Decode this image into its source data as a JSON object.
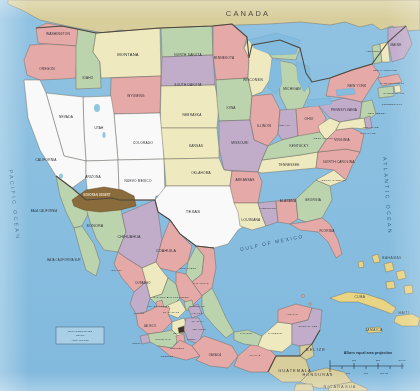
{
  "map": {
    "title": "Political map of the United States, Mexico and Central America",
    "projection_note": "Albers equal area projection",
    "countries": [
      {
        "name": "CANADA",
        "x": 248,
        "y": 14,
        "cls": "ctry"
      },
      {
        "name": "GUATEMALA",
        "x": 295,
        "y": 371,
        "cls": "ctry2"
      },
      {
        "name": "BELIZE",
        "x": 316,
        "y": 350,
        "cls": "ctry2"
      },
      {
        "name": "HONDURAS",
        "x": 318,
        "y": 375,
        "cls": "ctry2"
      },
      {
        "name": "NICARAGUA",
        "x": 340,
        "y": 387,
        "cls": "ctry2"
      }
    ],
    "oceans": [
      {
        "name": "PACIFIC OCEAN",
        "x": 14,
        "y": 205
      },
      {
        "name": "ATLANTIC OCEAN",
        "x": 387,
        "y": 196
      },
      {
        "name": "GULF OF MEXICO",
        "x": 272,
        "y": 243
      }
    ],
    "islands": [
      {
        "name": "BAHAMAS",
        "x": 392,
        "y": 258
      },
      {
        "name": "CUBA",
        "x": 360,
        "y": 297
      },
      {
        "name": "HAITI",
        "x": 404,
        "y": 313
      },
      {
        "name": "JAMAICA",
        "x": 374,
        "y": 330
      }
    ],
    "us_states": [
      {
        "name": "WASHINGTON",
        "x": 58,
        "y": 34,
        "cls": "st-sm"
      },
      {
        "name": "OREGON",
        "x": 47,
        "y": 69,
        "cls": "st-sm"
      },
      {
        "name": "IDAHO",
        "x": 88,
        "y": 78,
        "cls": "st-sm"
      },
      {
        "name": "MONTANA",
        "x": 128,
        "y": 55,
        "cls": "st"
      },
      {
        "name": "WYOMING",
        "x": 136,
        "y": 96,
        "cls": "st-sm"
      },
      {
        "name": "NORTH DAKOTA",
        "x": 188,
        "y": 55,
        "cls": "st-sm"
      },
      {
        "name": "SOUTH DAKOTA",
        "x": 188,
        "y": 85,
        "cls": "st-sm"
      },
      {
        "name": "NEBRASKA",
        "x": 192,
        "y": 115,
        "cls": "st-sm"
      },
      {
        "name": "MINNESOTA",
        "x": 224,
        "y": 58,
        "cls": "st-sm"
      },
      {
        "name": "IOWA",
        "x": 231,
        "y": 108,
        "cls": "st-sm"
      },
      {
        "name": "WISCONSIN",
        "x": 253,
        "y": 80,
        "cls": "st-sm"
      },
      {
        "name": "MICHIGAN",
        "x": 292,
        "y": 89,
        "cls": "st-sm"
      },
      {
        "name": "ILLINOIS",
        "x": 264,
        "y": 126,
        "cls": "st-sm"
      },
      {
        "name": "INDIANA",
        "x": 285,
        "y": 125,
        "cls": "st-xs"
      },
      {
        "name": "OHIO",
        "x": 309,
        "y": 119,
        "cls": "st-sm"
      },
      {
        "name": "MISSOURI",
        "x": 240,
        "y": 143,
        "cls": "st-sm"
      },
      {
        "name": "KANSAS",
        "x": 196,
        "y": 146,
        "cls": "st-sm"
      },
      {
        "name": "COLORADO",
        "x": 143,
        "y": 143,
        "cls": "st-sm"
      },
      {
        "name": "UTAH",
        "x": 99,
        "y": 128,
        "cls": "st-sm"
      },
      {
        "name": "NEVADA",
        "x": 66,
        "y": 117,
        "cls": "st-sm"
      },
      {
        "name": "CALIFORNIA",
        "x": 46,
        "y": 160,
        "cls": "st-sm"
      },
      {
        "name": "ARIZONA",
        "x": 93,
        "y": 177,
        "cls": "st-sm"
      },
      {
        "name": "NUEVO MEXICO",
        "x": 138,
        "y": 181,
        "cls": "st-sm"
      },
      {
        "name": "OKLAHOMA",
        "x": 201,
        "y": 173,
        "cls": "st-sm"
      },
      {
        "name": "TEXAS",
        "x": 193,
        "y": 212,
        "cls": "st"
      },
      {
        "name": "ARKANSAS",
        "x": 245,
        "y": 180,
        "cls": "st-sm"
      },
      {
        "name": "LOUISIANA",
        "x": 251,
        "y": 220,
        "cls": "st-sm"
      },
      {
        "name": "MISSISSIPPI",
        "x": 268,
        "y": 208,
        "cls": "st-xs"
      },
      {
        "name": "ALABAMA",
        "x": 288,
        "y": 201,
        "cls": "st-sm"
      },
      {
        "name": "TENNESSEE",
        "x": 289,
        "y": 165,
        "cls": "st-sm"
      },
      {
        "name": "KENTUCKY",
        "x": 299,
        "y": 146,
        "cls": "st-sm"
      },
      {
        "name": "GEORGIA",
        "x": 313,
        "y": 200,
        "cls": "st-sm"
      },
      {
        "name": "FLORIDA",
        "x": 327,
        "y": 231,
        "cls": "st-sm"
      },
      {
        "name": "SOUTH CAROLINA",
        "x": 334,
        "y": 180,
        "cls": "st-xs"
      },
      {
        "name": "NORTH CAROLINA",
        "x": 339,
        "y": 162,
        "cls": "st-sm"
      },
      {
        "name": "VIRGINIA",
        "x": 342,
        "y": 140,
        "cls": "st-sm"
      },
      {
        "name": "WEST VIRGINIA",
        "x": 324,
        "y": 138,
        "cls": "st-xs"
      },
      {
        "name": "PENNSYLVANIA",
        "x": 344,
        "y": 110,
        "cls": "st-sm"
      },
      {
        "name": "NEW YORK",
        "x": 357,
        "y": 86,
        "cls": "st-sm"
      },
      {
        "name": "VERMONT",
        "x": 373,
        "y": 51,
        "cls": "st-xs"
      },
      {
        "name": "MAINE",
        "x": 396,
        "y": 45,
        "cls": "st-sm"
      },
      {
        "name": "NEW HAMPSHIRE",
        "x": 385,
        "y": 70,
        "cls": "st-xs"
      },
      {
        "name": "MASSACHUSETTS",
        "x": 392,
        "y": 83,
        "cls": "st-xs"
      },
      {
        "name": "RHODE ISLAND",
        "x": 394,
        "y": 93,
        "cls": "st-xs"
      },
      {
        "name": "CONNECTICUT",
        "x": 392,
        "y": 104,
        "cls": "st-xs"
      },
      {
        "name": "NEW JERSEY",
        "x": 377,
        "y": 113,
        "cls": "st-xs"
      },
      {
        "name": "DELAWARE",
        "x": 371,
        "y": 127,
        "cls": "st-xs"
      },
      {
        "name": "MARYLAND",
        "x": 368,
        "y": 133,
        "cls": "st-xs"
      }
    ],
    "mexico_states": [
      {
        "name": "BAJA CALIFORNIA",
        "x": 44,
        "y": 211,
        "cls": "mx-sm"
      },
      {
        "name": "BAJA CALIFORNIA SUR",
        "x": 64,
        "y": 260,
        "cls": "mx-sm"
      },
      {
        "name": "SONORA",
        "x": 95,
        "y": 226,
        "cls": "mx"
      },
      {
        "name": "CHIHUAHUA",
        "x": 129,
        "y": 237,
        "cls": "mx"
      },
      {
        "name": "COAHUILA",
        "x": 166,
        "y": 251,
        "cls": "mx"
      },
      {
        "name": "NUEVO LEON",
        "x": 188,
        "y": 268,
        "cls": "mx-xs"
      },
      {
        "name": "TAMAULIPAS",
        "x": 201,
        "y": 283,
        "cls": "mx-xs"
      },
      {
        "name": "SINALOA",
        "x": 117,
        "y": 270,
        "cls": "mx-xs"
      },
      {
        "name": "DURANGO",
        "x": 143,
        "y": 283,
        "cls": "mx-sm"
      },
      {
        "name": "ZACATECAS",
        "x": 161,
        "y": 297,
        "cls": "mx-xs"
      },
      {
        "name": "SAN LUIS POTOSI",
        "x": 178,
        "y": 297,
        "cls": "mx-xs"
      },
      {
        "name": "NAYARIT",
        "x": 139,
        "y": 313,
        "cls": "mx-xs"
      },
      {
        "name": "AGUASCALIENTES",
        "x": 158,
        "y": 306,
        "cls": "mx-xs"
      },
      {
        "name": "GUANAJUATO",
        "x": 171,
        "y": 312,
        "cls": "mx-xs"
      },
      {
        "name": "QUERETARO",
        "x": 197,
        "y": 306,
        "cls": "mx-xs"
      },
      {
        "name": "HIDALGO",
        "x": 197,
        "y": 313,
        "cls": "mx-xs"
      },
      {
        "name": "TLAXCALA",
        "x": 198,
        "y": 321,
        "cls": "mx-xs"
      },
      {
        "name": "VERACRUZ",
        "x": 199,
        "y": 329,
        "cls": "mx-xs"
      },
      {
        "name": "JALISCO",
        "x": 150,
        "y": 326,
        "cls": "mx-sm"
      },
      {
        "name": "COLIMA",
        "x": 137,
        "y": 343,
        "cls": "mx-xs"
      },
      {
        "name": "MICHOACAN",
        "x": 163,
        "y": 339,
        "cls": "mx-xs"
      },
      {
        "name": "MEXICO",
        "x": 178,
        "y": 333,
        "cls": "mx-xs"
      },
      {
        "name": "MORELOS",
        "x": 167,
        "y": 356,
        "cls": "mx-xs"
      },
      {
        "name": "PUEBLA",
        "x": 192,
        "y": 339,
        "cls": "mx-xs"
      },
      {
        "name": "GUERRERO",
        "x": 177,
        "y": 348,
        "cls": "mx-xs"
      },
      {
        "name": "OAXACA",
        "x": 215,
        "y": 355,
        "cls": "mx-sm"
      },
      {
        "name": "CHIAPAS",
        "x": 255,
        "y": 355,
        "cls": "mx-xs"
      },
      {
        "name": "TABASCO",
        "x": 246,
        "y": 333,
        "cls": "mx-xs"
      },
      {
        "name": "CAMPECHE",
        "x": 275,
        "y": 333,
        "cls": "mx-xs"
      },
      {
        "name": "YUCATAN",
        "x": 292,
        "y": 314,
        "cls": "mx-xs"
      },
      {
        "name": "QUINTANA ROO",
        "x": 308,
        "y": 326,
        "cls": "mx-xs"
      }
    ],
    "highlight": {
      "name": "SONORAN DESERT",
      "x": 97,
      "y": 195
    },
    "legend_box": {
      "line1": "REVILLAGIGEDO ISLANDS",
      "line2": "(MEXICO)",
      "line3": "APROX. LOCATION"
    },
    "scale": {
      "title": "Albers equal area projection",
      "miles_ticks": [
        "0",
        "100",
        "200",
        "300 mi"
      ],
      "km_ticks": [
        "0",
        "100",
        "200",
        "300 km"
      ]
    }
  },
  "colors": {
    "water": "#87c4e8",
    "canada": "#ded29a",
    "land_unfilled": "#ffffff",
    "pink": "#eeaaa8",
    "green": "#bdd9ae",
    "yellow": "#f4efbe",
    "purple": "#c6aed0",
    "orange": "#f0c89a",
    "highlight_brown": "#8d6a33",
    "border": "#6b6256",
    "paper": "#f2efe6"
  }
}
